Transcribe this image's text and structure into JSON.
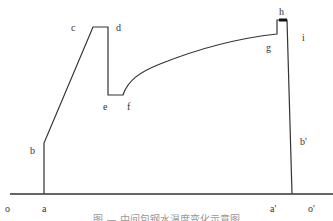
{
  "diagram": {
    "type": "process-curve-schematic",
    "line_color": "#333333",
    "points": {
      "a": [
        44,
        194
      ],
      "b": [
        44,
        143
      ],
      "c": [
        93,
        27
      ],
      "d": [
        108,
        27
      ],
      "e": [
        108,
        95
      ],
      "f": [
        123,
        95
      ],
      "g": [
        277,
        34
      ],
      "h": [
        282,
        20
      ],
      "i": [
        287,
        20
      ],
      "b_prime": [
        292,
        194
      ]
    },
    "baseline": {
      "x1": 10,
      "x2": 333,
      "y": 194
    },
    "labels": {
      "o": "o",
      "a": "a",
      "b": "b",
      "c": "c",
      "d": "d",
      "e": "e",
      "f": "f",
      "g": "g",
      "h": "h",
      "i": "i",
      "b_prime": "b'",
      "a_prime": "a'",
      "o_prime": "o'"
    },
    "caption": "图 — 中间包钢水温度变化示意图"
  }
}
